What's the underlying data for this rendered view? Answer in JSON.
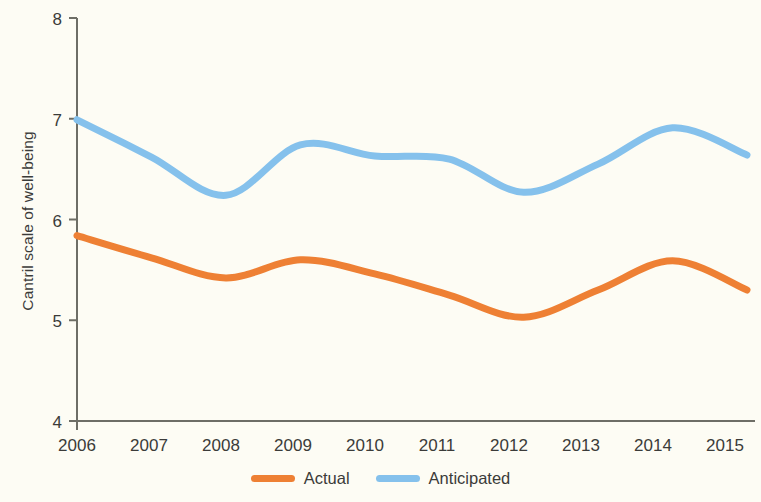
{
  "chart_data": {
    "type": "line",
    "title": "",
    "xlabel": "",
    "ylabel": "Cantril scale of well-being",
    "x": [
      2006,
      2007,
      2008,
      2009,
      2010,
      2011,
      2012,
      2013,
      2014,
      2015
    ],
    "categories": [
      "2006",
      "2007",
      "2008",
      "2009",
      "2010",
      "2011",
      "2012",
      "2013",
      "2014",
      "2015"
    ],
    "series": [
      {
        "name": "Actual",
        "color": "#ee8034",
        "values": [
          5.84,
          5.62,
          5.42,
          5.6,
          5.46,
          5.25,
          5.03,
          5.3,
          5.59,
          5.3
        ]
      },
      {
        "name": "Anticipated",
        "color": "#85c1ec",
        "values": [
          6.99,
          6.62,
          6.24,
          6.74,
          6.63,
          6.6,
          6.27,
          6.55,
          6.91,
          6.64
        ]
      }
    ],
    "ylim": [
      4,
      8
    ],
    "xlim": [
      2006,
      2015
    ],
    "yticks": [
      4,
      5,
      6,
      7,
      8
    ],
    "ytick_labels": [
      "4",
      "5",
      "6",
      "7",
      "8"
    ],
    "grid": false,
    "legend_position": "bottom-center",
    "smoothing": "spline"
  },
  "legend": {
    "entries": [
      {
        "label": "Actual",
        "color": "#ee8034"
      },
      {
        "label": "Anticipated",
        "color": "#85c1ec"
      }
    ]
  },
  "axes": {
    "y_title": "Cantril scale of well-being",
    "y_labels": [
      "8",
      "7",
      "6",
      "5",
      "4"
    ],
    "x_labels": [
      "2006",
      "2007",
      "2008",
      "2009",
      "2010",
      "2011",
      "2012",
      "2013",
      "2014",
      "2015"
    ]
  },
  "colors": {
    "background": "#fdfcf4",
    "axis": "#6e6e66",
    "text": "#3b3b39",
    "actual": "#ee8034",
    "anticipated": "#85c1ec"
  }
}
